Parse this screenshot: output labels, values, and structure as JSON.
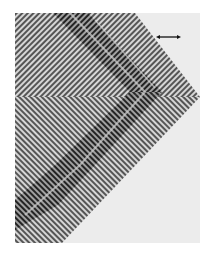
{
  "figure": {
    "colors": {
      "page_background": "#ffffff",
      "panel_background": "#ececec",
      "stripe_dark": "#4a4a4a",
      "stripe_light": "#d8d8d8",
      "band_dark": "#1e1e1e",
      "band_mid": "#8a8a8a",
      "scale_bar": "#111111"
    },
    "panel": {
      "x": 15,
      "y": 13,
      "width": 185,
      "height": 230
    },
    "chevron_outer": {
      "top_right_x": 135,
      "tip_x": 200,
      "tip_y": 97,
      "bottom_x": 62
    },
    "scale_bar": {
      "x1": 157,
      "x2": 180,
      "y": 37,
      "icon": "double-headed-arrow-icon"
    }
  }
}
